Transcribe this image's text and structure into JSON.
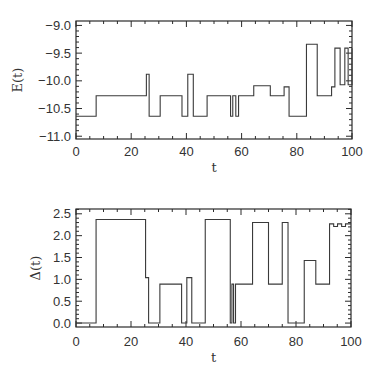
{
  "chart_data": [
    {
      "type": "line",
      "step": true,
      "title": "",
      "xlabel": "t",
      "ylabel": "E(t)",
      "xlim": [
        0,
        100
      ],
      "ylim": [
        -11.05,
        -8.92
      ],
      "xticks": [
        0,
        20,
        40,
        60,
        80,
        100
      ],
      "xtick_labels": [
        "0",
        "20",
        "40",
        "60",
        "80",
        "100"
      ],
      "yticks": [
        -9.0,
        -9.5,
        -10.0,
        -10.5,
        -11.0
      ],
      "ytick_labels": [
        "-9.0",
        "-9.5",
        "-10.0",
        "-10.5",
        "-11.0"
      ],
      "grid": false,
      "series": [
        {
          "name": "E(t)",
          "x": [
            0,
            7.3,
            25.5,
            26.5,
            30.5,
            38.4,
            40.5,
            42.5,
            47.5,
            56.0,
            56.8,
            57.9,
            58.9,
            64.4,
            70.4,
            75.4,
            77.2,
            83.5,
            87.4,
            92.6,
            93.8,
            95.7,
            97.4,
            98.6,
            100
          ],
          "values": [
            -10.64,
            -10.27,
            -9.88,
            -10.64,
            -10.27,
            -10.64,
            -9.88,
            -10.64,
            -10.27,
            -10.64,
            -10.27,
            -10.64,
            -10.27,
            -10.09,
            -10.27,
            -10.11,
            -10.64,
            -9.34,
            -10.27,
            -10.11,
            -9.41,
            -10.07,
            -9.41,
            -10.07,
            -9.41
          ]
        }
      ]
    },
    {
      "type": "line",
      "step": true,
      "title": "",
      "xlabel": "t",
      "ylabel": "Δ(t)",
      "xlim": [
        0,
        100
      ],
      "ylim": [
        -0.09,
        2.61
      ],
      "xticks": [
        0,
        20,
        40,
        60,
        80,
        100
      ],
      "xtick_labels": [
        "0",
        "20",
        "40",
        "60",
        "80",
        "100"
      ],
      "yticks": [
        2.5,
        2.0,
        1.5,
        1.0,
        0.5,
        0.0
      ],
      "ytick_labels": [
        "2.5",
        "2.0",
        "1.5",
        "1.0",
        "0.5",
        "0.0"
      ],
      "grid": false,
      "series": [
        {
          "name": "Δ(t)",
          "x": [
            0,
            7.3,
            25.3,
            26.4,
            30.5,
            38.4,
            40.3,
            42.1,
            47.0,
            56.1,
            56.7,
            57.3,
            58.0,
            64.2,
            70.0,
            75.0,
            77.1,
            83.0,
            87.2,
            92.2,
            93.7,
            95.1,
            96.6,
            98.0,
            100
          ],
          "values": [
            0.0,
            2.37,
            1.04,
            0.0,
            0.89,
            0.0,
            1.04,
            0.0,
            2.37,
            0.0,
            0.89,
            0.0,
            0.89,
            2.3,
            0.89,
            2.3,
            0.0,
            1.43,
            0.89,
            2.27,
            2.21,
            2.27,
            2.21,
            2.27,
            2.27
          ]
        }
      ]
    }
  ]
}
